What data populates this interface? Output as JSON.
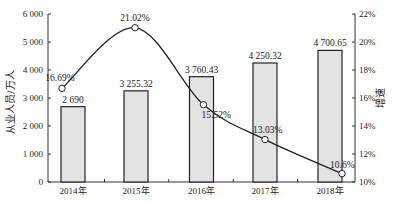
{
  "chart_data": {
    "type": "bar+line",
    "title": "",
    "categories": [
      "2014年",
      "2015年",
      "2016年",
      "2017年",
      "2018年"
    ],
    "series": [
      {
        "name": "从业人员/万人",
        "type": "bar",
        "axis": "left",
        "values": [
          2690,
          3255.32,
          3760.43,
          4250.32,
          4700.65
        ],
        "labels": [
          "2 690",
          "3 255.32",
          "3 760.43",
          "4 250.32",
          "4 700.65"
        ]
      },
      {
        "name": "增速",
        "type": "line",
        "axis": "right",
        "values": [
          16.69,
          21.02,
          15.52,
          13.03,
          10.6
        ],
        "labels": [
          "16.69%",
          "21.02%",
          "15.52%",
          "13.03%",
          "10.6%"
        ]
      }
    ],
    "ylabel": "从业人员/万人",
    "y2label": "增速",
    "ylim": [
      0,
      6000
    ],
    "y2lim": [
      10,
      22
    ],
    "yticks": [
      "0",
      "1 000",
      "2 000",
      "3 000",
      "4 000",
      "5 000",
      "6 000"
    ],
    "y2ticks": [
      "10%",
      "12%",
      "14%",
      "16%",
      "18%",
      "20%",
      "22%"
    ],
    "grid": false,
    "legend": "none",
    "colors": {
      "bar_fill": "#e3e3e3",
      "bar_stroke": "#222222",
      "line": "#222222",
      "marker_fill": "#ffffff"
    }
  }
}
